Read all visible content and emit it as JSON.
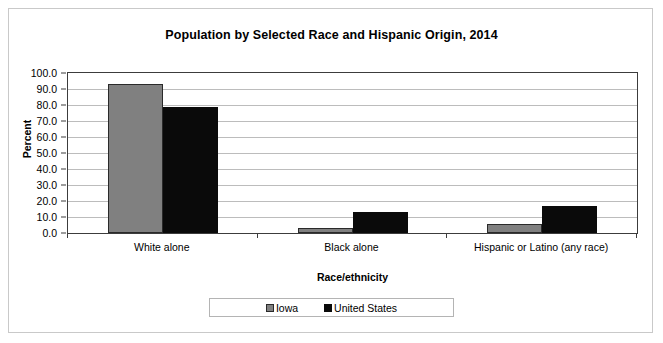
{
  "chart_data": {
    "type": "bar",
    "title": "Population by Selected Race and Hispanic Origin, 2014",
    "xlabel": "Race/ethnicity",
    "ylabel": "Percent",
    "categories": [
      "White alone",
      "Black alone",
      "Hispanic or Latino (any race)"
    ],
    "series": [
      {
        "name": "Iowa",
        "color": "#808080",
        "values": [
          93.0,
          3.4,
          5.6
        ]
      },
      {
        "name": "United States",
        "color": "#0a0a0a",
        "values": [
          79.0,
          13.0,
          17.0
        ]
      }
    ],
    "ylim": [
      0.0,
      100.0
    ],
    "ytick_labels": [
      "100.0",
      "90.0",
      "80.0",
      "70.0",
      "60.0",
      "50.0",
      "40.0",
      "30.0",
      "20.0",
      "10.0",
      "0.0"
    ],
    "ytick_values": [
      100.0,
      90.0,
      80.0,
      70.0,
      60.0,
      50.0,
      40.0,
      30.0,
      20.0,
      10.0,
      0.0
    ],
    "grid": true,
    "legend_position": "bottom"
  }
}
